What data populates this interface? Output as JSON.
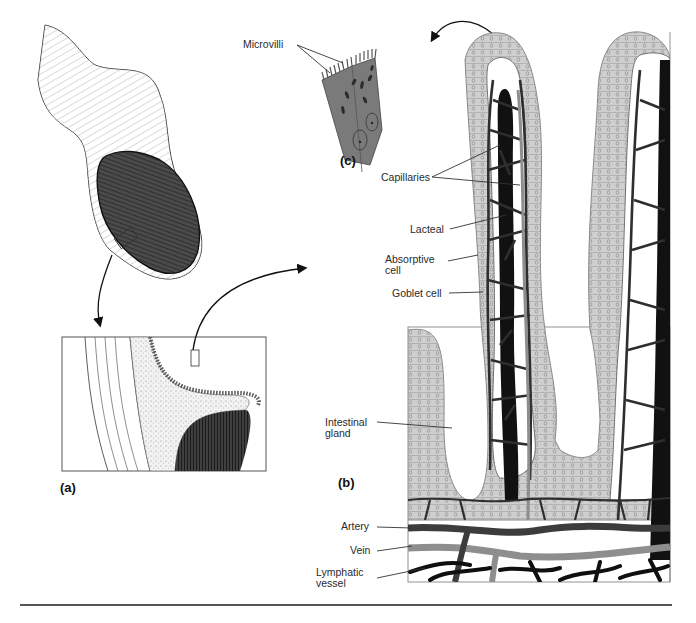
{
  "figure": {
    "panels": [
      {
        "id": "a",
        "tag": "(a)",
        "description": "Section of small intestine with enlarged wall cross-section"
      },
      {
        "id": "b",
        "tag": "(b)",
        "description": "Villi and intestinal glands with blood and lymph vessels"
      },
      {
        "id": "c",
        "tag": "(c)",
        "description": "Absorptive cells with microvilli"
      }
    ],
    "labels": {
      "microvilli": "Microvilli",
      "capillaries": "Capillaries",
      "lacteal": "Lacteal",
      "absorptive_cell": "Absorptive\ncell",
      "goblet_cell": "Goblet cell",
      "intestinal_gland": "Intestinal\ngland",
      "artery": "Artery",
      "vein": "Vein",
      "lymphatic_vessel": "Lymphatic\nvessel"
    },
    "colors": {
      "epithelium": "#cfcfcf",
      "cell_outline": "#6a6a6a",
      "lacteal": "#111111",
      "capillary": "#3a3a3a",
      "vein": "#8e8e8e",
      "artery": "#3c3c3c",
      "lymphatic": "#0f0f0f",
      "cell_body": "#7a7a7a",
      "mucosa_dark": "#3d3d3d",
      "rule": "#555555"
    }
  }
}
